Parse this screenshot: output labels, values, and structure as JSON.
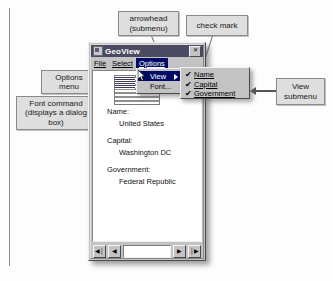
{
  "window": {
    "title": "GeoView",
    "title_icon": "app-globe-icon",
    "close_label": "✕",
    "menubar": [
      {
        "label": "File"
      },
      {
        "label": "Select"
      },
      {
        "label": "Options",
        "state": "active"
      }
    ],
    "record": {
      "fields": [
        {
          "label": "Name:",
          "value": "United States"
        },
        {
          "label": "Capital:",
          "value": "Washington DC"
        },
        {
          "label": "Government:",
          "value": "Federal Republic"
        }
      ]
    },
    "navigator": {
      "first_label": "◀│",
      "prev_label": "◀",
      "next_label": "▶",
      "last_label": "│▶"
    }
  },
  "options_menu": {
    "items": [
      {
        "label": "View",
        "state": "highlight",
        "has_submenu": true
      },
      {
        "label": "Font...",
        "state": "normal",
        "has_submenu": false
      }
    ]
  },
  "view_submenu": {
    "items": [
      {
        "label": "Name",
        "checked": true,
        "check": "✔"
      },
      {
        "label": "Capital",
        "checked": true,
        "check": "✔"
      },
      {
        "label": "Government",
        "checked": true,
        "check": "✔"
      }
    ]
  },
  "callouts": {
    "arrowhead": "arrowhead\n(submenu)",
    "check_mark": "check mark",
    "options_menu": "Options\nmenu",
    "font_command": "Font command\n(displays a dialog\nbox)",
    "view_submenu": "View\nsubmenu"
  },
  "colors": {
    "callout_fill": "#dedede",
    "callout_border": "#8a8a8a",
    "window_face": "#c3c3c3",
    "titlebar": "#4a4a62",
    "menu_highlight": "#000a64",
    "page_background": "#fdfdfd"
  }
}
